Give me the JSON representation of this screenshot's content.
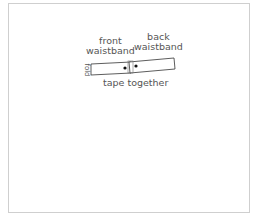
{
  "labels": {
    "front": "front\nwaistband",
    "back": "back\nwaistband",
    "fold": "fold",
    "tape": "tape together"
  },
  "colors": {
    "line": "#333333",
    "text": "#555555",
    "frame": "#cfcfcf"
  }
}
